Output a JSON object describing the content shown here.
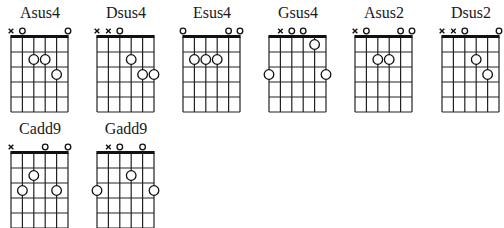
{
  "diagram": {
    "type": "guitar-chord-chart",
    "strings_count": 6,
    "frets_shown": 5,
    "string_order": [
      "E",
      "A",
      "D",
      "G",
      "B",
      "e"
    ],
    "marker_legend": {
      "x": "muted string",
      "o": "open string",
      "dot": "fretted note"
    },
    "chords": [
      {
        "name": "Asus4",
        "frets": [
          "x",
          0,
          2,
          2,
          3,
          0
        ]
      },
      {
        "name": "Dsus4",
        "frets": [
          "x",
          "x",
          0,
          2,
          3,
          3
        ]
      },
      {
        "name": "Esus4",
        "frets": [
          0,
          2,
          2,
          2,
          0,
          0
        ]
      },
      {
        "name": "Gsus4",
        "frets": [
          3,
          "x",
          0,
          0,
          1,
          3
        ]
      },
      {
        "name": "Asus2",
        "frets": [
          "x",
          0,
          2,
          2,
          0,
          0
        ]
      },
      {
        "name": "Dsus2",
        "frets": [
          "x",
          "x",
          0,
          2,
          3,
          0
        ]
      },
      {
        "name": "Cadd9",
        "frets": [
          "x",
          3,
          2,
          0,
          3,
          0
        ]
      },
      {
        "name": "Gadd9",
        "frets": [
          3,
          "x",
          0,
          2,
          0,
          3
        ]
      }
    ]
  }
}
